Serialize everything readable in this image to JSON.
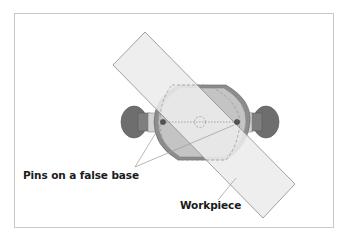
{
  "diagram": {
    "labels": {
      "pins": "Pins on a false base",
      "workpiece": "Workpiece"
    },
    "colors": {
      "frame": "#c8c8c8",
      "knob_dark": "#6e6e6e",
      "knob_mid": "#8a8a8a",
      "collar_light": "#cfcfcf",
      "body_fill": "#bdbdbd",
      "body_rim": "#8c8c8c",
      "workpiece_fill": "#ececec",
      "workpiece_stroke": "#8a8a8a",
      "dashed_outline": "#8f8f8f",
      "leader_line": "#9a9a9a",
      "text": "#1a1a1a"
    },
    "components": [
      "left-clamp-knob",
      "right-clamp-knob",
      "fixture-body",
      "left-pin",
      "right-pin",
      "center-hole",
      "workpiece",
      "dashed-false-base-outline"
    ]
  }
}
